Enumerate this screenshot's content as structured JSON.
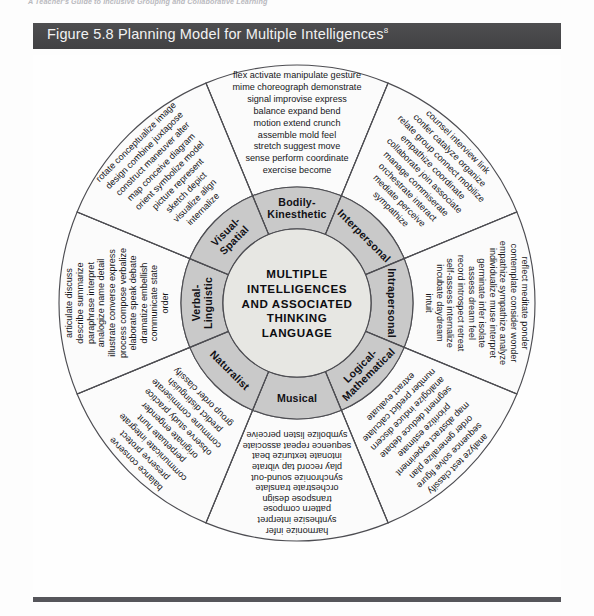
{
  "page": {
    "running_head": "A Teacher's Guide to Inclusive Grouping and Collaborative Learning"
  },
  "caption": {
    "text": "Figure 5.8 Planning Model for Multiple Intelligences",
    "superscript": "8"
  },
  "figure": {
    "center_lines": [
      "MULTIPLE",
      "INTELLIGENCES",
      "AND ASSOCIATED",
      "THINKING",
      "LANGUAGE"
    ],
    "colors": {
      "caption_bar": "#4a4a4c",
      "outer_ring": "#fbfbfb",
      "middle_ring": "#c9c9c9",
      "hub": "#e7e7e3",
      "stroke": "#4d4d52",
      "text": "#16161a"
    },
    "segments": [
      {
        "id": "bodily-kinesthetic",
        "label": "Bodily-\nKinesthetic",
        "label_line1": "Bodily-",
        "label_line2": "Kinesthetic",
        "rows": [
          "flex  activate  manipulate  gesture",
          "mime  choreograph  demonstrate",
          "signal  improvise  express",
          "balance  expand  bend",
          "motion  extend  crunch",
          "assemble  mold  feel",
          "stretch  suggest  move",
          "sense  perform  coordinate",
          "exercise  become"
        ],
        "words": [
          "flex",
          "activate",
          "manipulate",
          "gesture",
          "mime",
          "choreograph",
          "demonstrate",
          "signal",
          "improvise",
          "express",
          "balance",
          "expand",
          "bend",
          "motion",
          "extend",
          "crunch",
          "assemble",
          "mold",
          "feel",
          "stretch",
          "suggest",
          "move",
          "sense",
          "perform",
          "coordinate",
          "exercise",
          "become"
        ]
      },
      {
        "id": "interpersonal",
        "label": "Interpersonal",
        "label_line1": "Interpersonal",
        "label_line2": "",
        "rows": [
          "counsel  interview  link",
          "confer  catalyze  organize",
          "relate  group  connect  mobilize",
          "empathize  coordinate",
          "collaborate  join  associate",
          "manage  commiserate",
          "orchestrate  interact",
          "mediate  perceive",
          "sympathize"
        ],
        "words": [
          "counsel",
          "interview",
          "link",
          "confer",
          "catalyze",
          "organize",
          "relate",
          "group",
          "connect",
          "mobilize",
          "empathize",
          "coordinate",
          "collaborate",
          "join",
          "associate",
          "manage",
          "commiserate",
          "orchestrate",
          "interact",
          "mediate",
          "perceive",
          "sympathize"
        ]
      },
      {
        "id": "intrapersonal",
        "label": "Intrapersonal",
        "label_line1": "Intrapersonal",
        "label_line2": "",
        "rows": [
          "reflect  meditate  ponder",
          "contemplate  consider  wonder",
          "empathize  sympathize  analyze",
          "individualize  muse  interpret",
          "germinate  infer  isolate",
          "assess  dream  feel",
          "record  introspect  retreat",
          "self-assess  internalize",
          "incubate  daydream",
          "intuit"
        ],
        "words": [
          "reflect",
          "meditate",
          "ponder",
          "contemplate",
          "consider",
          "wonder",
          "empathize",
          "sympathize",
          "analyze",
          "individualize",
          "muse",
          "interpret",
          "germinate",
          "infer",
          "isolate",
          "assess",
          "dream",
          "feel",
          "record",
          "introspect",
          "retreat",
          "self-assess",
          "internalize",
          "incubate",
          "daydream",
          "intuit"
        ]
      },
      {
        "id": "logical-mathematical",
        "label": "Logical-\nMathematical",
        "label_line1": "Logical-",
        "label_line2": "Mathematical",
        "rows": [
          "analyze  test  classify",
          "sequence  solve  figure",
          "order  generalize  plan",
          "map  abstract  experiment",
          "prioritize  estimate",
          "segment  deduce  debate",
          "analogize  induce  discern",
          "number  predict  calculate",
          "extract  evaluate"
        ],
        "words": [
          "analyze",
          "test",
          "classify",
          "sequence",
          "solve",
          "figure",
          "order",
          "generalize",
          "plan",
          "map",
          "abstract",
          "experiment",
          "prioritize",
          "estimate",
          "segment",
          "deduce",
          "debate",
          "analogize",
          "induce",
          "discern",
          "number",
          "predict",
          "calculate",
          "extract",
          "evaluate"
        ]
      },
      {
        "id": "musical",
        "label": "Musical",
        "label_line1": "Musical",
        "label_line2": "",
        "rows": [
          "harmonize  infer",
          "synthesize  interpret",
          "pattern  compose",
          "transpose  design",
          "orchestrate  translate",
          "synchronize  sound-out",
          "play  record  tap  vibrate",
          "intonate  texturize  beat",
          "sequence  repeat  associate",
          "symbolize  listen  perceive"
        ],
        "words": [
          "harmonize",
          "infer",
          "synthesize",
          "interpret",
          "pattern",
          "compose",
          "transpose",
          "design",
          "orchestrate",
          "translate",
          "synchronize",
          "sound-out",
          "play",
          "record",
          "tap",
          "vibrate",
          "intonate",
          "texturize",
          "beat",
          "sequence",
          "repeat",
          "associate",
          "symbolize",
          "listen",
          "perceive"
        ]
      },
      {
        "id": "naturalist",
        "label": "Naturalist",
        "label_line1": "Naturalist",
        "label_line2": "",
        "rows": [
          "balance  conserve",
          "preserve  protect",
          "communicate  integrate",
          "perpetuate  hunt",
          "originate  engender",
          "observe  study  practice",
          "commune  commiserate",
          "predict  distinguish",
          "group  order  classify"
        ],
        "words": [
          "balance",
          "conserve",
          "preserve",
          "protect",
          "communicate",
          "integrate",
          "perpetuate",
          "hunt",
          "originate",
          "engender",
          "observe",
          "study",
          "practice",
          "commune",
          "commiserate",
          "predict",
          "distinguish",
          "group",
          "order",
          "classify"
        ]
      },
      {
        "id": "verbal-linguistic",
        "label": "Verbal-\nLinguistic",
        "label_line1": "Verbal-",
        "label_line2": "Linguistic",
        "rows": [
          "articulate  discuss",
          "describe  summarize",
          "paraphrase  interpret",
          "analogize  name  detail",
          "illustrate  converse  express",
          "process  compose  verbalize",
          "elaborate  speak  debate",
          "dramatize  embellish",
          "communicate  state",
          "order"
        ],
        "words": [
          "articulate",
          "discuss",
          "describe",
          "summarize",
          "paraphrase",
          "interpret",
          "analogize",
          "name",
          "detail",
          "illustrate",
          "converse",
          "express",
          "process",
          "compose",
          "verbalize",
          "elaborate",
          "speak",
          "debate",
          "dramatize",
          "embellish",
          "communicate",
          "state",
          "order"
        ]
      },
      {
        "id": "visual-spatial",
        "label": "Visual-\nSpatial",
        "label_line1": "Visual-",
        "label_line2": "Spatial",
        "rows": [
          "rotate  conceptualize  image",
          "design  combine  juxtapose",
          "construct  maneuver  alter",
          "map  conceive  diagram",
          "orient  symbolize  model",
          "picture  represent",
          "sketch  depict",
          "visualize  align",
          "internalize"
        ],
        "words": [
          "rotate",
          "conceptualize",
          "image",
          "design",
          "combine",
          "juxtapose",
          "construct",
          "maneuver",
          "alter",
          "map",
          "conceive",
          "diagram",
          "orient",
          "symbolize",
          "model",
          "picture",
          "represent",
          "sketch",
          "depict",
          "visualize",
          "align",
          "internalize"
        ]
      }
    ]
  }
}
